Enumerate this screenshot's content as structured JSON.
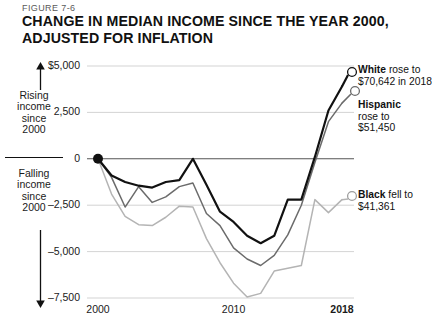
{
  "figure": {
    "number": "FIGURE 7-6",
    "title_line_1": "CHANGE IN MEDIAN INCOME SINCE THE YEAR 2000,",
    "title_line_2": "ADJUSTED FOR INFLATION"
  },
  "annotations": {
    "rising": {
      "l1": "Rising",
      "l2": "income",
      "l3": "since",
      "l4": "2000"
    },
    "falling": {
      "l1": "Falling",
      "l2": "income",
      "l3": "since",
      "l4": "2000"
    },
    "up_arrow_icon": "arrow-up-icon",
    "down_arrow_icon": "arrow-down-icon"
  },
  "series_labels": {
    "white": {
      "name": "White",
      "rest": " rose to",
      "line2": "$70,642 in 2018"
    },
    "hispanic": {
      "name": "Hispanic",
      "line2": "rose to",
      "line3": "$51,450"
    },
    "black": {
      "name": "Black",
      "rest": " fell to",
      "line2": "$41,361"
    }
  },
  "chart_data": {
    "type": "line",
    "title": "CHANGE IN MEDIAN INCOME SINCE THE YEAR 2000, ADJUSTED FOR INFLATION",
    "xlabel": "",
    "ylabel": "",
    "grid": true,
    "legend_position": "right-inline-labels",
    "xlim": [
      2000,
      2018
    ],
    "ylim": [
      -7500,
      5000
    ],
    "yticks": [
      5000,
      2500,
      0,
      -2500,
      -5000,
      -7500
    ],
    "ytick_labels": [
      "$5,000",
      "2,500",
      "0",
      "–2,500",
      "–5,000",
      "–7,500"
    ],
    "xticks": [
      2000,
      2010,
      2018
    ],
    "xtick_labels": [
      "2000",
      "2010",
      "2018"
    ],
    "x": [
      2000,
      2001,
      2002,
      2003,
      2004,
      2005,
      2006,
      2007,
      2008,
      2009,
      2010,
      2011,
      2012,
      2013,
      2014,
      2015,
      2016,
      2017,
      2018
    ],
    "series": [
      {
        "name": "White",
        "color": "#111111",
        "width": 2.2,
        "end_marker": "open-circle",
        "values": [
          0,
          -900,
          -1250,
          -1450,
          -1550,
          -1250,
          -1150,
          0,
          -1400,
          -2850,
          -3400,
          -4150,
          -4550,
          -4150,
          -2200,
          -2200,
          100,
          2600,
          3900
        ]
      },
      {
        "name": "Hispanic",
        "color": "#6b6b6b",
        "width": 1.5,
        "end_marker": "open-circle",
        "values": [
          0,
          -1000,
          -2600,
          -1500,
          -2350,
          -2050,
          -1500,
          -1300,
          -2950,
          -3600,
          -4800,
          -5400,
          -5750,
          -5200,
          -4100,
          -2500,
          -200,
          2000,
          3000
        ]
      },
      {
        "name": "Black",
        "color": "#b4b4b4",
        "width": 1.5,
        "end_marker": "open-circle",
        "values": [
          0,
          -1900,
          -3100,
          -3550,
          -3600,
          -3150,
          -2550,
          -2600,
          -4300,
          -5600,
          -6700,
          -7450,
          -7250,
          -6050,
          -5900,
          -5750,
          -2200,
          -2900,
          -2200
        ]
      }
    ],
    "start_marker": {
      "x": 2000,
      "y": 0,
      "style": "filled-circle"
    }
  }
}
